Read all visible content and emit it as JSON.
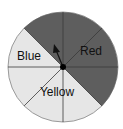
{
  "figure": {
    "type": "spinner",
    "sector_count": 8,
    "center": [
      63,
      67
    ],
    "radius": 55,
    "colors": {
      "dark": "#5e5e5e",
      "light": "#e6e6e6",
      "outline": "#9a9a9a",
      "divider": "#3a3a3a",
      "text": "#111111"
    },
    "regions": [
      {
        "label": "Red",
        "sectors": 4,
        "shade": "dark"
      },
      {
        "label": "Blue",
        "sectors": 1,
        "shade": "light"
      },
      {
        "label": "Yellow",
        "sectors": 3,
        "shade": "light"
      }
    ],
    "pointer": {
      "direction": "up-left",
      "color": "#111111"
    }
  },
  "labels": {
    "red": "Red",
    "blue": "Blue",
    "yellow": "Yellow"
  }
}
